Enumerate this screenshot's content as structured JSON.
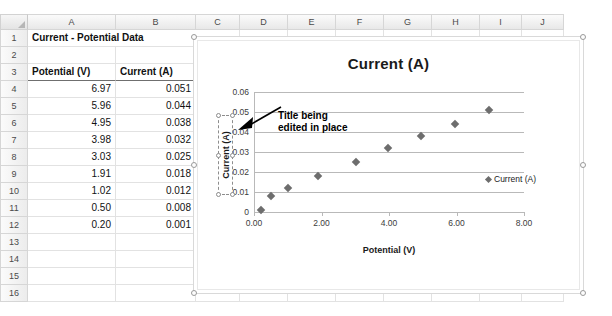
{
  "spreadsheet": {
    "columns": [
      "A",
      "B",
      "C",
      "D",
      "E",
      "F",
      "G",
      "H",
      "I",
      "J"
    ],
    "rows": [
      "1",
      "2",
      "3",
      "4",
      "5",
      "6",
      "7",
      "8",
      "9",
      "10",
      "11",
      "12",
      "13",
      "14",
      "15",
      "16"
    ],
    "title_cell": "Current - Potential Data",
    "headers": {
      "potential": "Potential (V)",
      "current": "Current (A)"
    },
    "data": [
      {
        "potential": "6.97",
        "current": "0.051"
      },
      {
        "potential": "5.96",
        "current": "0.044"
      },
      {
        "potential": "4.95",
        "current": "0.038"
      },
      {
        "potential": "3.98",
        "current": "0.032"
      },
      {
        "potential": "3.03",
        "current": "0.025"
      },
      {
        "potential": "1.91",
        "current": "0.018"
      },
      {
        "potential": "1.02",
        "current": "0.012"
      },
      {
        "potential": "0.50",
        "current": "0.008"
      },
      {
        "potential": "0.20",
        "current": "0.001"
      }
    ]
  },
  "chart": {
    "title": "Current (A)",
    "xaxis_title": "Potential (V)",
    "yaxis_title": "Current (A)",
    "legend_label": "Current (A)",
    "annotation_line1": "Title being",
    "annotation_line2": "edited in place",
    "marker_color": "#6d6d6d",
    "gridline_color": "#b9b9b9"
  },
  "chart_data": {
    "type": "scatter",
    "title": "Current (A)",
    "xlabel": "Potential (V)",
    "ylabel": "Current (A)",
    "xlim": [
      0,
      8
    ],
    "ylim": [
      0,
      0.06
    ],
    "xticks": [
      "0.00",
      "2.00",
      "4.00",
      "6.00",
      "8.00"
    ],
    "yticks": [
      "0",
      "0.01",
      "0.02",
      "0.03",
      "0.04",
      "0.05",
      "0.06"
    ],
    "grid": true,
    "legend_position": "right",
    "series": [
      {
        "name": "Current (A)",
        "x": [
          6.97,
          5.96,
          4.95,
          3.98,
          3.03,
          1.91,
          1.02,
          0.5,
          0.2
        ],
        "y": [
          0.051,
          0.044,
          0.038,
          0.032,
          0.025,
          0.018,
          0.012,
          0.008,
          0.001
        ]
      }
    ]
  }
}
